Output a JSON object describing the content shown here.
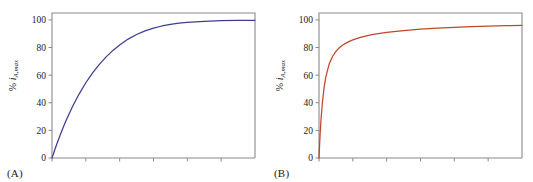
{
  "figure": {
    "background": "#ffffff",
    "width": 533,
    "height": 182
  },
  "panels": [
    {
      "tag": "(A)",
      "ylabel_prefix": "% ",
      "ylabel_symbol": "i",
      "ylabel_subscript": "A,max",
      "color": "#3d3f8f",
      "frame_color": "#8a8a8a",
      "chart_data": {
        "type": "line",
        "title": "",
        "xlabel": "",
        "ylabel": "% i_A,max",
        "xlim": [
          0,
          6
        ],
        "ylim": [
          0,
          105
        ],
        "yticks": [
          0,
          20,
          40,
          60,
          80,
          100
        ],
        "ytick_labels": [
          "0",
          "20",
          "40",
          "60",
          "80",
          "100"
        ],
        "xticks": [
          0,
          1,
          2,
          3,
          4,
          5
        ],
        "xtick_labels": [
          "",
          "",
          "",
          "",
          "",
          ""
        ],
        "grid": false,
        "legend": "none",
        "series": [
          {
            "name": "A",
            "color": "#3d3f8f",
            "x": [
              0,
              0.1,
              0.2,
              0.3,
              0.4,
              0.5,
              0.6,
              0.8,
              1.0,
              1.2,
              1.4,
              1.6,
              1.8,
              2.0,
              2.25,
              2.5,
              2.75,
              3.0,
              3.25,
              3.5,
              3.75,
              4.0,
              4.5,
              5.0,
              5.5,
              6.0
            ],
            "y": [
              0,
              7.2,
              14.0,
              20.3,
              26.2,
              31.7,
              36.9,
              46.3,
              54.5,
              61.6,
              67.8,
              73.2,
              77.9,
              81.9,
              86.1,
              89.4,
              92.0,
              94.0,
              95.6,
              96.7,
              97.6,
              98.2,
              99.0,
              99.4,
              99.6,
              99.7
            ]
          }
        ]
      }
    },
    {
      "tag": "(B)",
      "ylabel_prefix": "% ",
      "ylabel_symbol": "i",
      "ylabel_subscript": "A,max",
      "color": "#c0462a",
      "frame_color": "#8a8a8a",
      "chart_data": {
        "type": "line",
        "title": "",
        "xlabel": "",
        "ylabel": "% i_A,max",
        "xlim": [
          0,
          6
        ],
        "ylim": [
          0,
          105
        ],
        "yticks": [
          0,
          20,
          40,
          60,
          80,
          100
        ],
        "ytick_labels": [
          "0",
          "20",
          "40",
          "60",
          "80",
          "100"
        ],
        "xticks": [
          0,
          1,
          2,
          3,
          4,
          5
        ],
        "xtick_labels": [
          "",
          "",
          "",
          "",
          "",
          ""
        ],
        "grid": false,
        "legend": "none",
        "series": [
          {
            "name": "B",
            "color": "#c0462a",
            "x": [
              0,
              0.03,
              0.06,
              0.1,
              0.15,
              0.2,
              0.3,
              0.4,
              0.5,
              0.6,
              0.7,
              0.85,
              1.0,
              1.2,
              1.4,
              1.6,
              1.8,
              2.0,
              2.5,
              3.0,
              3.5,
              4.0,
              4.5,
              5.0,
              5.5,
              6.0
            ],
            "y": [
              0,
              16.0,
              28.0,
              40.0,
              51.0,
              58.5,
              68.0,
              73.5,
              77.2,
              79.8,
              81.8,
              83.9,
              85.5,
              87.2,
              88.5,
              89.5,
              90.3,
              91.0,
              92.3,
              93.3,
              94.0,
              94.6,
              95.1,
              95.5,
              95.8,
              96.1
            ]
          }
        ]
      }
    }
  ]
}
